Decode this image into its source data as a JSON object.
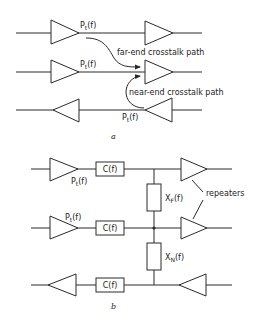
{
  "diagram_a": {
    "caption": "a",
    "signal_label_main": "P",
    "signal_label_sub": "t",
    "signal_label_arg": "(f)",
    "far_end_label": "far-end crosstalk path",
    "near_end_label": "near-end crosstalk path"
  },
  "diagram_b": {
    "caption": "b",
    "signal_label_main": "P",
    "signal_label_sub": "t",
    "signal_label_arg": "(f)",
    "coupling_label": "C(f)",
    "far_end_impedance_main": "X",
    "far_end_impedance_sub": "F",
    "far_end_impedance_arg": "(f)",
    "near_end_impedance_main": "X",
    "near_end_impedance_sub": "N",
    "near_end_impedance_arg": "(f)",
    "repeaters_label": "repeaters"
  },
  "colors": {
    "stroke": "#2a2a2a",
    "background": "#ffffff"
  }
}
